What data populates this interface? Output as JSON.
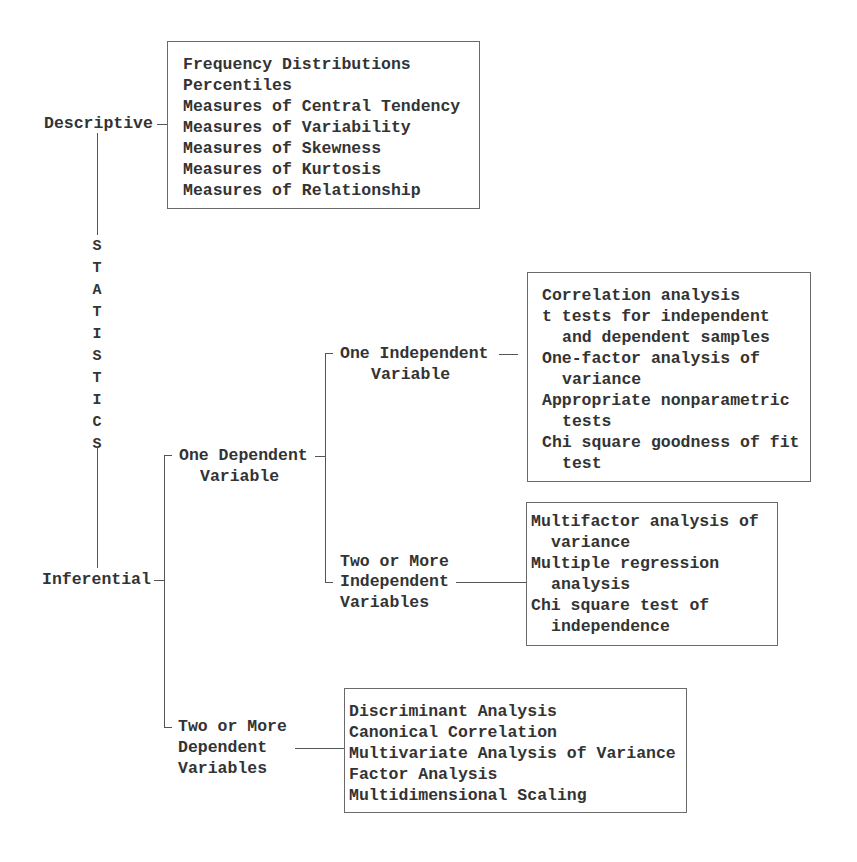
{
  "root": {
    "label": "STATISTICS",
    "letters": [
      "S",
      "T",
      "A",
      "T",
      "I",
      "S",
      "T",
      "I",
      "C",
      "S"
    ]
  },
  "descriptive": {
    "label": "Descriptive",
    "items": [
      "Frequency Distributions",
      "Percentiles",
      "Measures of Central Tendency",
      "Measures of Variability",
      "Measures of Skewness",
      "Measures of Kurtosis",
      "Measures of Relationship"
    ]
  },
  "inferential": {
    "label": "Inferential",
    "one_dependent": {
      "label_line1": "One Dependent",
      "label_line2": "Variable",
      "one_independent": {
        "label_line1": "One Independent",
        "label_line2": "Variable",
        "items": [
          {
            "text": "Correlation analysis",
            "indent": false
          },
          {
            "text": "t tests for independent",
            "indent": false
          },
          {
            "text": "and dependent samples",
            "indent": true
          },
          {
            "text": "One-factor analysis of",
            "indent": false
          },
          {
            "text": "variance",
            "indent": true
          },
          {
            "text": "Appropriate nonparametric",
            "indent": false
          },
          {
            "text": "tests",
            "indent": true
          },
          {
            "text": "Chi square goodness of fit",
            "indent": false
          },
          {
            "text": "test",
            "indent": true
          }
        ]
      },
      "two_or_more_independent": {
        "label_line1": "Two or More",
        "label_line2": "Independent",
        "label_line3": "Variables",
        "items": [
          {
            "text": "Multifactor analysis of",
            "indent": false
          },
          {
            "text": "variance",
            "indent": true
          },
          {
            "text": "Multiple regression",
            "indent": false
          },
          {
            "text": "analysis",
            "indent": true
          },
          {
            "text": "Chi square test of",
            "indent": false
          },
          {
            "text": "independence",
            "indent": true
          }
        ]
      }
    },
    "two_or_more_dependent": {
      "label_line1": "Two or More",
      "label_line2": "Dependent",
      "label_line3": "Variables",
      "items": [
        "Discriminant Analysis",
        "Canonical Correlation",
        "Multivariate Analysis of Variance",
        "Factor Analysis",
        "Multidimensional Scaling"
      ]
    }
  }
}
